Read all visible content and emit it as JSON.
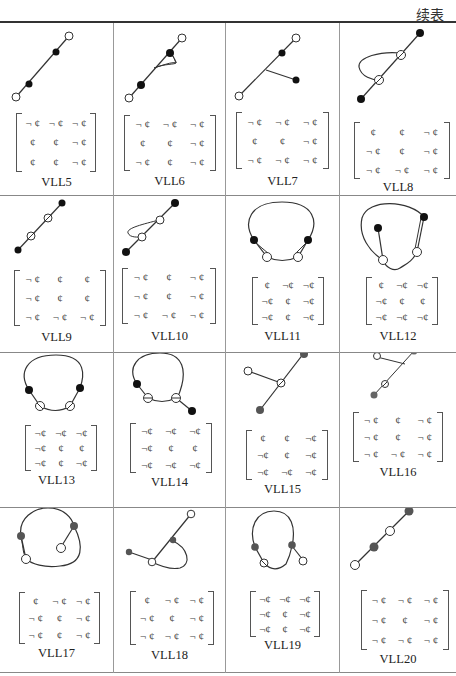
{
  "header": {
    "continuation_label": "续表"
  },
  "cells": [
    {
      "label": "VLL5",
      "matrix": [
        [
          "¬ ¢",
          "¬ ¢",
          "¬ ¢"
        ],
        [
          "¢",
          "¢",
          "¬ ¢"
        ],
        [
          "¢",
          "¢",
          "¬ ¢"
        ]
      ]
    },
    {
      "label": "VLL6",
      "matrix": [
        [
          "¬ ¢",
          "¬ ¢",
          "¬ ¢"
        ],
        [
          "¢",
          "¢",
          "¬ ¢"
        ],
        [
          "¬ ¢",
          "¢",
          "¬ ¢"
        ]
      ]
    },
    {
      "label": "VLL7",
      "matrix": [
        [
          "¬ ¢",
          "¬ ¢",
          "¬ ¢"
        ],
        [
          "¢",
          "¢",
          "¬ ¢"
        ],
        [
          "¬ ¢",
          "¬ ¢",
          "¬ ¢"
        ]
      ]
    },
    {
      "label": "VLL8",
      "matrix": [
        [
          "¢",
          "¢",
          "¬ ¢"
        ],
        [
          "¬ ¢",
          "¢",
          "¬ ¢"
        ],
        [
          "¬ ¢",
          "¬ ¢",
          "¬ ¢"
        ]
      ]
    },
    {
      "label": "VLL9",
      "matrix": [
        [
          "¬ ¢",
          "¢",
          "¢"
        ],
        [
          "¬ ¢",
          "¢",
          "¢"
        ],
        [
          "¬ ¢",
          "¬ ¢",
          "¬ ¢"
        ]
      ]
    },
    {
      "label": "VLL10",
      "matrix": [
        [
          "¬ ¢",
          "¢",
          "¬ ¢"
        ],
        [
          "¬ ¢",
          "¢",
          "¬ ¢"
        ],
        [
          "¬ ¢",
          "¬ ¢",
          "¬ ¢"
        ]
      ]
    },
    {
      "label": "VLL11",
      "matrix": [
        [
          "¢",
          "¬¢",
          "¬¢"
        ],
        [
          "¬¢",
          "¢",
          "¬¢"
        ],
        [
          "¬¢",
          "¢",
          "¬¢"
        ]
      ]
    },
    {
      "label": "VLL12",
      "matrix": [
        [
          "¢",
          "¬¢",
          "¬¢"
        ],
        [
          "¬¢",
          "¢",
          "¢"
        ],
        [
          "¬¢",
          "¬¢",
          "¬¢"
        ]
      ]
    },
    {
      "label": "VLL13",
      "matrix": [
        [
          "¬¢",
          "¬¢",
          "¬¢"
        ],
        [
          "¬¢",
          "¢",
          "¢"
        ],
        [
          "¬¢",
          "¢",
          "¬¢"
        ]
      ]
    },
    {
      "label": "VLL14",
      "matrix": [
        [
          "¬¢",
          "¬¢",
          "¬¢"
        ],
        [
          "¬¢",
          "¢",
          "¢"
        ],
        [
          "¬¢",
          "¬¢",
          "¬¢"
        ]
      ]
    },
    {
      "label": "VLL15",
      "matrix": [
        [
          "¢",
          "¢",
          "¬¢"
        ],
        [
          "¬¢",
          "¢",
          "¬¢"
        ],
        [
          "¬¢",
          "¬¢",
          "¬¢"
        ]
      ]
    },
    {
      "label": "VLL16",
      "matrix": [
        [
          "¬ ¢",
          "¢",
          "¬ ¢"
        ],
        [
          "¬ ¢",
          "¢",
          "¬ ¢"
        ],
        [
          "¬ ¢",
          "¬ ¢",
          "¬ ¢"
        ]
      ]
    },
    {
      "label": "VLL17",
      "matrix": [
        [
          "¢",
          "¬ ¢",
          "¬ ¢"
        ],
        [
          "¬ ¢",
          "¢",
          "¬ ¢"
        ],
        [
          "¬ ¢",
          "¢",
          "¬ ¢"
        ]
      ]
    },
    {
      "label": "VLL18",
      "matrix": [
        [
          "¢",
          "¬ ¢",
          "¬ ¢"
        ],
        [
          "¬ ¢",
          "¢",
          "¬ ¢"
        ],
        [
          "¬ ¢",
          "¬ ¢",
          "¬ ¢"
        ]
      ]
    },
    {
      "label": "VLL19",
      "matrix": [
        [
          "¬¢",
          "¬¢",
          "¬¢"
        ],
        [
          "¬¢",
          "¢",
          "¬¢"
        ],
        [
          "¬¢",
          "¢",
          "¬¢"
        ]
      ]
    },
    {
      "label": "VLL20",
      "matrix": [
        [
          "¬ ¢",
          "¬ ¢",
          "¬ ¢"
        ],
        [
          "¬ ¢",
          "¢",
          "¬ ¢"
        ],
        [
          "¬ ¢",
          "¬ ¢",
          "¬ ¢"
        ]
      ]
    }
  ]
}
